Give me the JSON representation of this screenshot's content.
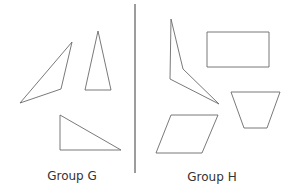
{
  "groups": [
    {
      "label": "Group G",
      "label_pos": [
        72,
        169
      ],
      "shapes": [
        {
          "name": "obtuse-triangle",
          "points": [
            [
              20,
              103
            ],
            [
              72,
              42
            ],
            [
              61,
              89
            ]
          ]
        },
        {
          "name": "isosceles-triangle",
          "points": [
            [
              98,
              31
            ],
            [
              85,
              90
            ],
            [
              111,
              90
            ]
          ]
        },
        {
          "name": "right-triangle",
          "points": [
            [
              60,
              115
            ],
            [
              60,
              150
            ],
            [
              121,
              150
            ]
          ]
        }
      ]
    },
    {
      "label": "Group H",
      "label_pos": [
        212,
        170
      ],
      "shapes": [
        {
          "name": "concave-quadrilateral",
          "points": [
            [
              171,
              19
            ],
            [
              183,
              69
            ],
            [
              219,
              104
            ],
            [
              170,
              79
            ]
          ]
        },
        {
          "name": "rectangle",
          "points": [
            [
              207,
              32
            ],
            [
              269,
              32
            ],
            [
              269,
              67
            ],
            [
              207,
              67
            ]
          ]
        },
        {
          "name": "trapezoid",
          "points": [
            [
              231,
              92
            ],
            [
              280,
              92
            ],
            [
              267,
              128
            ],
            [
              244,
              128
            ]
          ]
        },
        {
          "name": "parallelogram",
          "points": [
            [
              171,
              115
            ],
            [
              218,
              115
            ],
            [
              202,
              153
            ],
            [
              156,
              153
            ]
          ]
        }
      ]
    }
  ],
  "divider": {
    "x": 135,
    "y1": 4,
    "y2": 173
  },
  "colors": {
    "stroke": "#6a6a6a",
    "divider": "#3a3a3a",
    "text": "#333333"
  }
}
